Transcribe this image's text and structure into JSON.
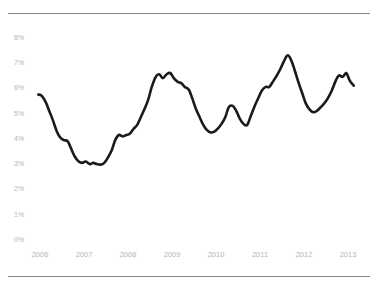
{
  "chart_data": {
    "type": "line",
    "title": "",
    "subtitle": "",
    "xlabel": "",
    "ylabel": "",
    "xlim": [
      2005.93,
      2013.22
    ],
    "ylim": [
      0,
      8
    ],
    "grid": false,
    "legend": null,
    "legend_position": "none",
    "line_color": "#1a1a1a",
    "line_width": 2.6,
    "axis_label_color": "#b5b5b5",
    "rule_color": "#8a8a8a",
    "background": "#ffffff",
    "y_ticks": [
      "0%",
      "1%",
      "2%",
      "3%",
      "4%",
      "5%",
      "6%",
      "7%",
      "8%"
    ],
    "y_tick_values": [
      0,
      1,
      2,
      3,
      4,
      5,
      6,
      7,
      8
    ],
    "x_ticks": [
      "2006",
      "2007",
      "2008",
      "2009",
      "2010",
      "2011",
      "2012",
      "2013"
    ],
    "x_tick_values": [
      2006,
      2007,
      2008,
      2009,
      2010,
      2011,
      2012,
      2013
    ],
    "series": [
      {
        "name": "rate",
        "x": [
          2005.96,
          2006.04,
          2006.13,
          2006.21,
          2006.29,
          2006.38,
          2006.46,
          2006.54,
          2006.63,
          2006.71,
          2006.79,
          2006.88,
          2006.96,
          2007.04,
          2007.13,
          2007.21,
          2007.29,
          2007.38,
          2007.46,
          2007.54,
          2007.63,
          2007.71,
          2007.79,
          2007.88,
          2007.96,
          2008.04,
          2008.13,
          2008.21,
          2008.29,
          2008.38,
          2008.46,
          2008.54,
          2008.63,
          2008.71,
          2008.79,
          2008.88,
          2008.96,
          2009.04,
          2009.13,
          2009.21,
          2009.29,
          2009.38,
          2009.46,
          2009.54,
          2009.63,
          2009.71,
          2009.79,
          2009.88,
          2009.96,
          2010.04,
          2010.13,
          2010.21,
          2010.29,
          2010.38,
          2010.46,
          2010.54,
          2010.63,
          2010.71,
          2010.79,
          2010.88,
          2010.96,
          2011.04,
          2011.13,
          2011.21,
          2011.29,
          2011.38,
          2011.46,
          2011.54,
          2011.63,
          2011.71,
          2011.79,
          2011.88,
          2011.96,
          2012.04,
          2012.13,
          2012.21,
          2012.29,
          2012.38,
          2012.46,
          2012.54,
          2012.63,
          2012.71,
          2012.79,
          2012.88,
          2012.96,
          2013.04,
          2013.13
        ],
        "values": [
          5.75,
          5.7,
          5.45,
          5.1,
          4.75,
          4.3,
          4.05,
          3.95,
          3.9,
          3.6,
          3.3,
          3.1,
          3.05,
          3.1,
          3.0,
          3.05,
          3.0,
          2.98,
          3.05,
          3.25,
          3.55,
          3.95,
          4.15,
          4.1,
          4.15,
          4.2,
          4.4,
          4.55,
          4.85,
          5.2,
          5.55,
          6.05,
          6.45,
          6.55,
          6.4,
          6.55,
          6.6,
          6.4,
          6.25,
          6.2,
          6.05,
          5.95,
          5.6,
          5.2,
          4.85,
          4.55,
          4.35,
          4.25,
          4.28,
          4.4,
          4.6,
          4.85,
          5.25,
          5.3,
          5.1,
          4.8,
          4.58,
          4.55,
          4.9,
          5.3,
          5.6,
          5.9,
          6.05,
          6.05,
          6.25,
          6.5,
          6.75,
          7.05,
          7.3,
          7.1,
          6.7,
          6.2,
          5.8,
          5.4,
          5.15,
          5.05,
          5.1,
          5.25,
          5.4,
          5.6,
          5.9,
          6.25,
          6.5,
          6.45,
          6.6,
          6.3,
          6.1
        ]
      }
    ],
    "annotations": []
  },
  "figure": {
    "top_rule": "horizontal-rule",
    "bottom_rule": "horizontal-rule"
  }
}
